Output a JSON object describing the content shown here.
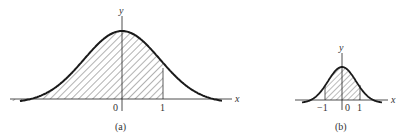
{
  "figure": {
    "panels": [
      {
        "id": "a",
        "caption": "(a)",
        "x_axis_label": "x",
        "y_axis_label": "y",
        "tick_labels": [
          "0",
          "1"
        ],
        "shaded_region": {
          "from": "-inf",
          "to": 1
        },
        "curve": "bell (normal density), wide"
      },
      {
        "id": "b",
        "caption": "(b)",
        "x_axis_label": "x",
        "y_axis_label": "y",
        "tick_labels": [
          "−1",
          "0",
          "1"
        ],
        "shaded_region": {
          "from": -1,
          "to": 1
        },
        "curve": "bell (normal density), narrow"
      }
    ],
    "colors": {
      "ink": "#1a1a1a",
      "hatch": "#555555",
      "background": "#ffffff"
    }
  }
}
